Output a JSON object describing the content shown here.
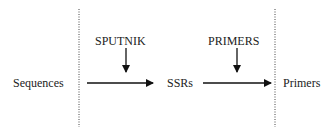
{
  "diagram": {
    "nodes": [
      {
        "id": "sequences",
        "label": "Sequences"
      },
      {
        "id": "ssrs",
        "label": "SSRs"
      },
      {
        "id": "primers",
        "label": "Primers"
      }
    ],
    "tools": [
      {
        "id": "sputnik",
        "label": "SPUTNIK"
      },
      {
        "id": "primers_tool",
        "label": "PRIMERS"
      }
    ],
    "edges": [
      {
        "from": "sequences",
        "to": "ssrs",
        "via": "sputnik"
      },
      {
        "from": "ssrs",
        "to": "primers",
        "via": "primers_tool"
      }
    ],
    "colors": {
      "line": "#111111",
      "text": "#222222",
      "background": "#ffffff"
    }
  }
}
